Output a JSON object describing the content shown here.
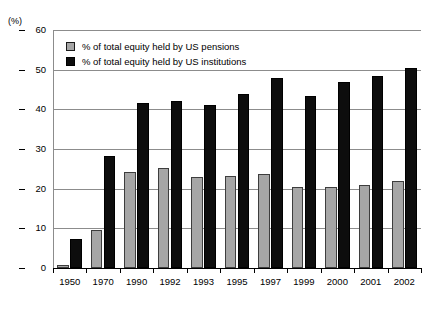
{
  "chart_data": {
    "type": "bar",
    "title": "",
    "subtitle": "",
    "xlabel": "",
    "ylabel": "",
    "axis_unit_label": "(%)",
    "ylim": [
      0,
      60
    ],
    "ytick_step": 10,
    "yticks": [
      0,
      10,
      20,
      30,
      40,
      50,
      60
    ],
    "grid": true,
    "grid_axis": "y",
    "legend_position": "top-left-inside",
    "categories": [
      "1950",
      "1970",
      "1990",
      "1992",
      "1993",
      "1995",
      "1997",
      "1999",
      "2000",
      "2001",
      "2002"
    ],
    "series": [
      {
        "name": "% of total equity held by US pensions",
        "color": "#a6a6a6",
        "values": [
          0.8,
          9.5,
          24.3,
          25.3,
          23.0,
          23.3,
          23.8,
          20.3,
          20.4,
          21.0,
          22.0
        ]
      },
      {
        "name": "% of total equity held by US institutions",
        "color": "#0d0d0d",
        "values": [
          7.2,
          28.2,
          41.5,
          42.0,
          41.2,
          43.8,
          48.0,
          43.4,
          47.0,
          48.4,
          50.3
        ]
      }
    ]
  },
  "legend": {
    "items": [
      {
        "label": "% of total equity held by US pensions",
        "swatch": "pensions"
      },
      {
        "label": "% of total equity held by US institutions",
        "swatch": "institutions"
      }
    ]
  }
}
